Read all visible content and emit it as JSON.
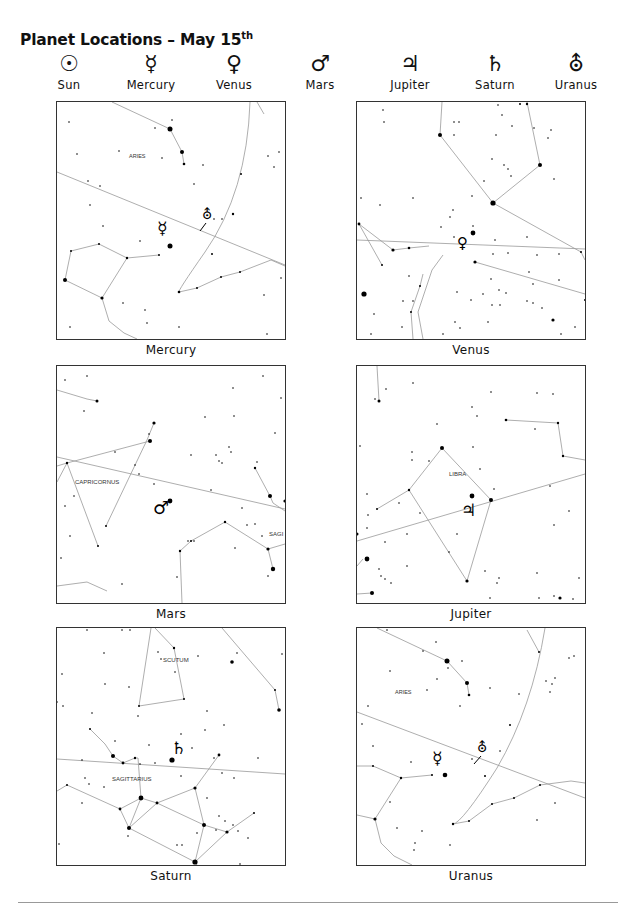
{
  "title": {
    "text": "Planet Locations – May 15",
    "superscript": "th"
  },
  "legend": [
    {
      "name": "Sun",
      "symbol": "☉",
      "icon": "sun-icon"
    },
    {
      "name": "Mercury",
      "symbol": "☿",
      "icon": "mercury-icon"
    },
    {
      "name": "Venus",
      "symbol": "♀",
      "icon": "venus-icon"
    },
    {
      "name": "Mars",
      "symbol": "♂",
      "icon": "mars-icon"
    },
    {
      "name": "Jupiter",
      "symbol": "♃",
      "icon": "jupiter-icon"
    },
    {
      "name": "Saturn",
      "symbol": "♄",
      "icon": "saturn-icon"
    },
    {
      "name": "Uranus",
      "symbol": "⛢",
      "icon": "uranus-icon"
    }
  ],
  "panels": [
    {
      "caption": "Mercury",
      "constellation_labels": [
        "ARIES"
      ],
      "planet_symbols": [
        "☿",
        "⛢"
      ]
    },
    {
      "caption": "Venus",
      "constellation_labels": [],
      "planet_symbols": [
        "♀"
      ]
    },
    {
      "caption": "Mars",
      "constellation_labels": [
        "CAPRICORNUS",
        "SAGI"
      ],
      "planet_symbols": [
        "♂"
      ]
    },
    {
      "caption": "Jupiter",
      "constellation_labels": [
        "LIBRA"
      ],
      "planet_symbols": [
        "♃"
      ]
    },
    {
      "caption": "Saturn",
      "constellation_labels": [
        "SCUTUM",
        "SAGITTARIUS"
      ],
      "planet_symbols": [
        "♄"
      ]
    },
    {
      "caption": "Uranus",
      "constellation_labels": [
        "ARIES"
      ],
      "planet_symbols": [
        "☿",
        "⛢"
      ]
    }
  ]
}
